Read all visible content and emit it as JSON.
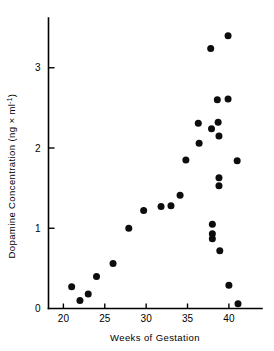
{
  "chart_data": {
    "type": "scatter",
    "title": "",
    "subtitle": "",
    "xlabel": "Weeks of Gestation",
    "ylabel": "Dopamine Concentration (ng × ml⁻¹)",
    "ylabel_main": "Dopamine Concentration (ng × ml",
    "ylabel_exponent": "-1",
    "ylabel_close": ")",
    "xlim": [
      18.2,
      44.0
    ],
    "ylim": [
      0,
      3.62
    ],
    "xticks": [
      20,
      25,
      30,
      35,
      40
    ],
    "yticks": [
      0,
      1,
      2,
      3
    ],
    "xtick_labels": [
      "20",
      "25",
      "30",
      "35",
      "40"
    ],
    "ytick_labels": [
      "0",
      "1",
      "2",
      "3"
    ],
    "grid": false,
    "legend": "none",
    "marker": "filled-circle",
    "marker_color": "#0d0d0d",
    "series": [
      {
        "name": "Dopamine concentration",
        "points": [
          [
            21.0,
            0.27
          ],
          [
            22.0,
            0.1
          ],
          [
            23.0,
            0.18
          ],
          [
            24.0,
            0.4
          ],
          [
            26.0,
            0.56
          ],
          [
            27.9,
            1.0
          ],
          [
            29.7,
            1.22
          ],
          [
            31.8,
            1.27
          ],
          [
            33.0,
            1.28
          ],
          [
            34.1,
            1.41
          ],
          [
            34.8,
            1.85
          ],
          [
            36.3,
            2.31
          ],
          [
            36.4,
            2.06
          ],
          [
            37.8,
            3.24
          ],
          [
            37.9,
            2.24
          ],
          [
            38.0,
            1.05
          ],
          [
            38.0,
            0.93
          ],
          [
            38.0,
            0.87
          ],
          [
            38.6,
            2.6
          ],
          [
            38.7,
            2.32
          ],
          [
            38.8,
            2.15
          ],
          [
            38.8,
            1.63
          ],
          [
            38.8,
            1.53
          ],
          [
            38.9,
            0.72
          ],
          [
            39.9,
            3.4
          ],
          [
            39.9,
            2.61
          ],
          [
            40.0,
            0.29
          ],
          [
            41.0,
            1.84
          ],
          [
            41.1,
            0.06
          ]
        ]
      }
    ]
  }
}
